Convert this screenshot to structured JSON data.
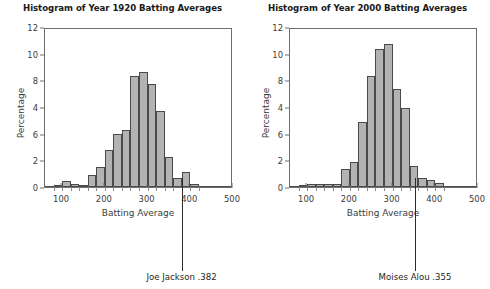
{
  "figure": {
    "width": 490,
    "height": 289,
    "background": "#ffffff",
    "bar_fill": "#b3b3b3",
    "bar_stroke": "#4a4a4a",
    "axis_color": "#6f6f6f",
    "text_color": "#3b3b3b"
  },
  "chart_data": [
    {
      "type": "bar",
      "id": "histogram-1920",
      "title": "Histogram of Year 1920 Batting Averages",
      "xlabel": "Batting Average",
      "ylabel": "Percentage",
      "xlim": [
        60,
        500
      ],
      "ylim": [
        0,
        12
      ],
      "xticks": [
        100,
        200,
        300,
        400,
        500
      ],
      "yticks": [
        "12",
        "10",
        "8",
        "4",
        "6",
        "2",
        "0"
      ],
      "ytick_values": [
        12,
        10,
        8,
        6,
        4,
        2,
        0
      ],
      "grid": false,
      "legend": null,
      "bin_width": 20,
      "bin_starts": [
        80,
        100,
        120,
        140,
        160,
        180,
        200,
        220,
        240,
        260,
        280,
        300,
        320,
        340,
        360,
        380,
        400
      ],
      "categories": [
        "80-100",
        "100-120",
        "120-140",
        "140-160",
        "160-180",
        "180-200",
        "200-220",
        "220-240",
        "240-260",
        "260-280",
        "280-300",
        "300-320",
        "320-340",
        "340-360",
        "360-380",
        "380-400",
        "400-420"
      ],
      "values": [
        0.0,
        0.45,
        0.2,
        0.15,
        0.9,
        1.5,
        2.8,
        3.95,
        4.25,
        8.35,
        8.6,
        7.75,
        5.7,
        2.25,
        0.7,
        1.15,
        0.25
      ],
      "annotation": {
        "label": "Joe Jackson .382",
        "x_value": 382,
        "text": "Joe Jackson .382"
      }
    },
    {
      "type": "bar",
      "id": "histogram-2000",
      "title": "Histogram of Year 2000 Batting Averages",
      "xlabel": "Batting Average",
      "ylabel": "Percentage",
      "xlim": [
        60,
        500
      ],
      "ylim": [
        0,
        12
      ],
      "xticks": [
        100,
        200,
        300,
        400,
        500
      ],
      "yticks": [
        "12",
        "10",
        "8",
        "4",
        "6",
        "2",
        "0"
      ],
      "ytick_values": [
        12,
        10,
        8,
        6,
        4,
        2,
        0
      ],
      "grid": false,
      "legend": null,
      "bin_width": 20,
      "bin_starts": [
        80,
        100,
        120,
        140,
        160,
        180,
        200,
        220,
        240,
        260,
        280,
        300,
        320,
        340,
        360,
        380,
        400
      ],
      "categories": [
        "80-100",
        "100-120",
        "120-140",
        "140-160",
        "160-180",
        "180-200",
        "200-220",
        "220-240",
        "240-260",
        "260-280",
        "280-300",
        "300-320",
        "320-340",
        "340-360",
        "360-380",
        "380-400",
        "400-420"
      ],
      "values": [
        0.1,
        0.2,
        0.2,
        0.2,
        0.25,
        1.35,
        1.9,
        4.9,
        8.3,
        10.35,
        10.7,
        7.35,
        5.9,
        1.55,
        0.7,
        0.5,
        0.3
      ],
      "annotation": {
        "label": "Moises Alou .355",
        "x_value": 355,
        "text": "Moises Alou .355"
      }
    }
  ],
  "panels": [
    {
      "title": "Histogram of Year 1920 Batting Averages",
      "xlabel": "Batting Average",
      "ylabel": "Percentage",
      "annotation": "Joe Jackson .382"
    },
    {
      "title": "Histogram of Year 2000 Batting Averages",
      "xlabel": "Batting Average",
      "ylabel": "Percentage",
      "annotation": "Moises Alou .355"
    }
  ]
}
